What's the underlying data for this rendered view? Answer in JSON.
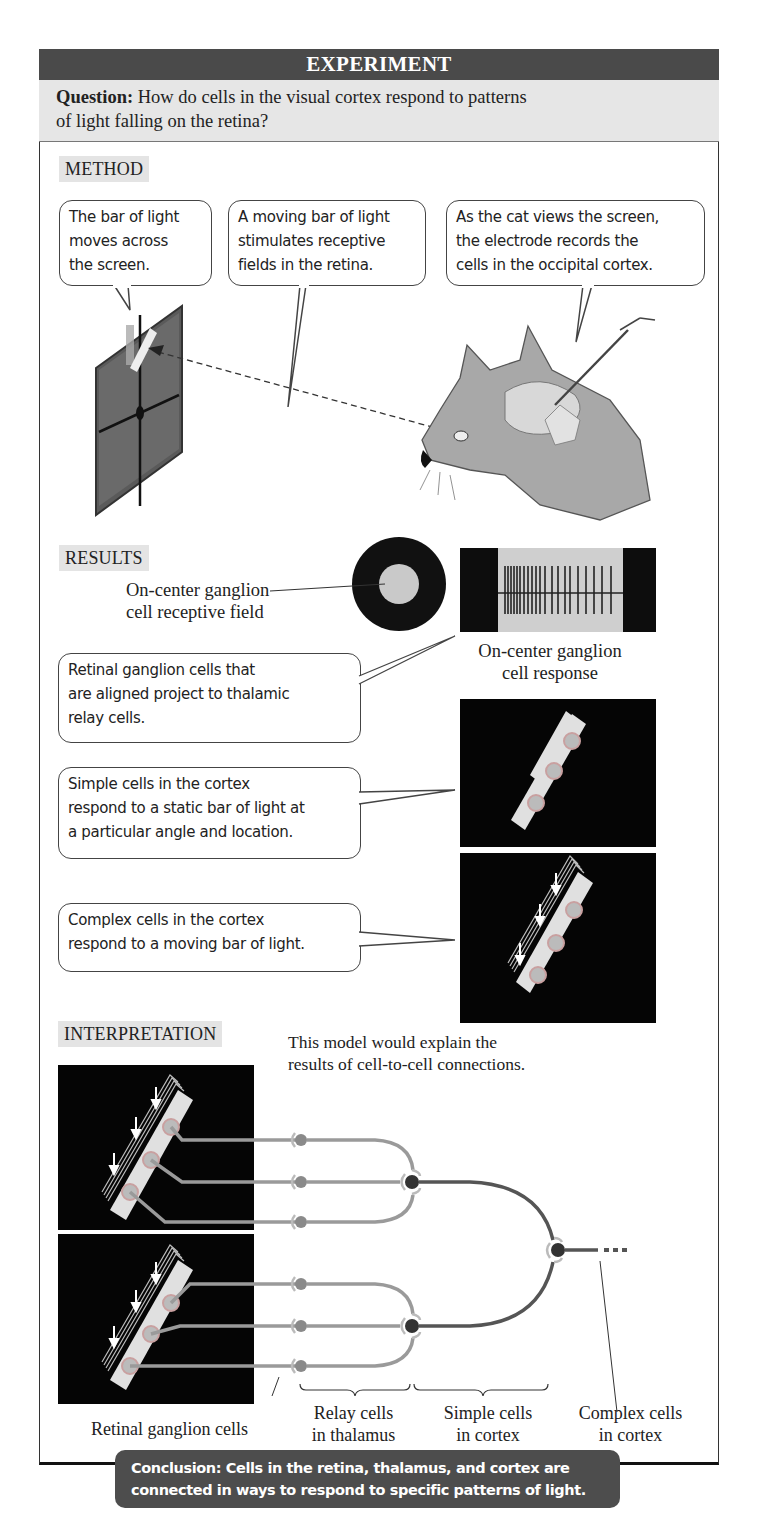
{
  "header": {
    "title": "EXPERIMENT"
  },
  "question": {
    "label": "Question:",
    "text": " How do cells in the visual cortex respond to patterns",
    "text2": "of light falling on the retina?"
  },
  "method": {
    "label": "METHOD",
    "bubbles": [
      {
        "lines": [
          "The bar of light",
          "moves across",
          "the screen."
        ]
      },
      {
        "lines": [
          "A moving bar of light",
          "stimulates receptive",
          "fields in the retina."
        ]
      },
      {
        "lines": [
          "As the cat views the screen,",
          "the electrode records the",
          "cells in the occipital cortex."
        ]
      }
    ]
  },
  "results": {
    "label": "RESULTS",
    "receptive_field_label": [
      "On-center ganglion",
      "cell receptive field"
    ],
    "response_label": [
      "On-center ganglion",
      "cell response"
    ],
    "bubbles": [
      {
        "lines": [
          "Retinal ganglion cells that",
          "are aligned project to thalamic",
          "relay cells."
        ]
      },
      {
        "lines": [
          "Simple cells in the cortex",
          "respond to a static bar of light at",
          "a particular angle and location."
        ]
      },
      {
        "lines": [
          "Complex cells in the cortex",
          "respond to a moving bar of light."
        ]
      }
    ]
  },
  "interpretation": {
    "label": "INTERPRETATION",
    "note": [
      "This model would explain the",
      "results of cell-to-cell connections."
    ],
    "labels": {
      "retinal": "Retinal ganglion cells",
      "relay": [
        "Relay cells",
        "in thalamus"
      ],
      "simple": [
        "Simple cells",
        "in cortex"
      ],
      "complex": [
        "Complex cells",
        "in cortex"
      ]
    }
  },
  "conclusion": {
    "lines": [
      "Conclusion: Cells in the retina, thalamus, and cortex are",
      "connected in ways to respond to  specific  patterns of light."
    ]
  },
  "colors": {
    "header_bg": "#4a4a4a",
    "question_bg": "#e6e6e6",
    "label_bg": "#e4e4e4",
    "axon_light": "#9a9a9a",
    "axon_dark": "#555555",
    "conclusion_bg": "#4d4d4d"
  }
}
